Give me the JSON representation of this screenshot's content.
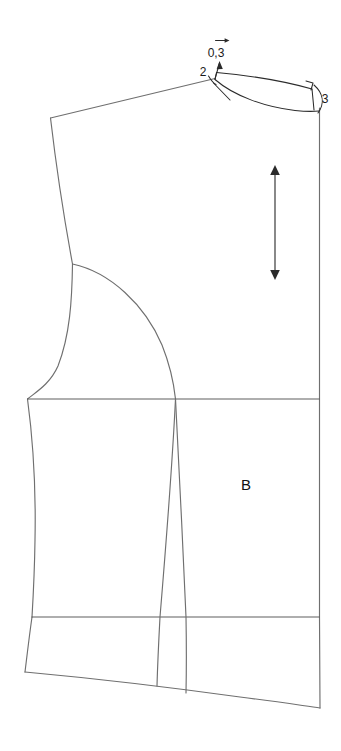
{
  "document": {
    "title": "Bodice Back Pattern Draft",
    "background_color": "#ffffff",
    "line_color": "#6f6f6f",
    "detail_color": "#2b2b2b",
    "text_color": "#1a1a1a",
    "width": 341,
    "height": 751
  },
  "piece": {
    "label": "B",
    "label_x": 246,
    "label_y": 490
  },
  "annotations": [
    {
      "id": "neck-rise-measure",
      "label": "0,3",
      "x": 216,
      "y": 57,
      "description": "neck point rise measurement"
    },
    {
      "id": "shoulder-measure",
      "label": "2",
      "x": 203,
      "y": 76,
      "description": "shoulder extension measurement"
    },
    {
      "id": "center-back-neck-measure",
      "label": "3",
      "x": 325,
      "y": 103,
      "description": "center back neck drop measurement"
    }
  ],
  "grainline": {
    "name": "grain-line",
    "x": 275,
    "top_y": 166,
    "bottom_y": 279,
    "arrow_head": "double"
  },
  "markers": {
    "right_angle": {
      "name": "right-angle-mark",
      "x": 313,
      "y": 77
    },
    "direction_arrow": {
      "name": "direction-arrow",
      "x": 222,
      "y": 41
    }
  },
  "construction_lines": [
    {
      "name": "bust-line",
      "y": 399,
      "x1": 27,
      "x2": 320
    },
    {
      "name": "waist-line",
      "y": 617,
      "x1": 32,
      "x2": 320
    }
  ]
}
